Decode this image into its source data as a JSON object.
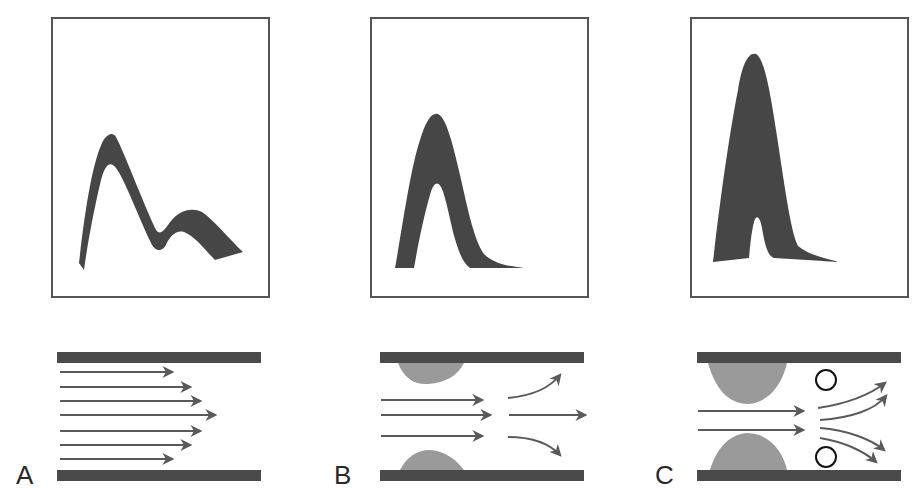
{
  "colors": {
    "background": "#ffffff",
    "frame": "#555555",
    "waveform": "#464646",
    "wall": "#4a4a4a",
    "plaque": "#9a9a9a",
    "arrow": "#5a5a5a",
    "bubble": "#111111"
  },
  "panels": [
    {
      "id": "A",
      "label": "A",
      "waveform": "normal-triphasic-doppler",
      "flow": "laminar",
      "arrows": 7,
      "stenosis": "none"
    },
    {
      "id": "B",
      "label": "B",
      "waveform": "moderate-stenosis-broadened",
      "flow": "mild-disturbed",
      "arrows": 3,
      "stenosis": "moderate"
    },
    {
      "id": "C",
      "label": "C",
      "waveform": "severe-stenosis-spectral-broadening",
      "flow": "turbulent-with-eddies",
      "arrows": 2,
      "stenosis": "severe",
      "eddies": 2
    }
  ]
}
